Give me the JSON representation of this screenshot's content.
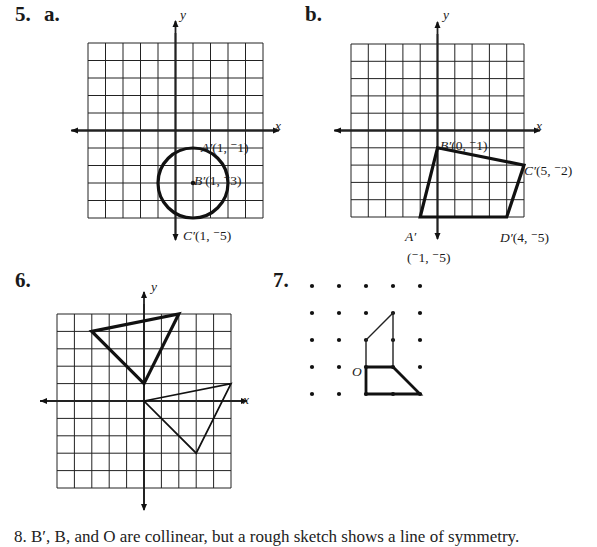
{
  "problems": {
    "p5": {
      "number": "5.",
      "a": {
        "label": "a.",
        "axis_x": "x",
        "axis_y": "y",
        "shape": "circle",
        "center": [
          1,
          -3
        ],
        "radius": 2,
        "points": [
          {
            "name": "A′",
            "coords": "(1, ⁻1)"
          },
          {
            "name": "B′",
            "coords": "(1, ⁻3)"
          },
          {
            "name": "C′",
            "coords": "(1, ⁻5)"
          }
        ]
      },
      "b": {
        "label": "b.",
        "axis_x": "x",
        "axis_y": "y",
        "shape": "quadrilateral",
        "points": [
          {
            "name": "A′",
            "coords": "(⁻1, ⁻5)",
            "xy": [
              -1,
              -5
            ]
          },
          {
            "name": "B′",
            "coords": "(0, ⁻1)",
            "xy": [
              0,
              -1
            ]
          },
          {
            "name": "C′",
            "coords": "(5, ⁻2)",
            "xy": [
              5,
              -2
            ]
          },
          {
            "name": "D′",
            "coords": "(4, ⁻5)",
            "xy": [
              4,
              -5
            ]
          }
        ]
      }
    },
    "p6": {
      "number": "6.",
      "axis_x": "x",
      "axis_y": "y",
      "thick_triangle": [
        [
          -3,
          4
        ],
        [
          2,
          5
        ],
        [
          0,
          1
        ]
      ],
      "thin_triangle": [
        [
          0,
          0
        ],
        [
          5,
          1
        ],
        [
          3,
          -3
        ]
      ]
    },
    "p7": {
      "number": "7.",
      "origin_label": "O",
      "dot_grid": "5x5"
    }
  },
  "bottom_text": "8.  B′, B, and O are collinear, but a rough sketch shows a line of symmetry."
}
